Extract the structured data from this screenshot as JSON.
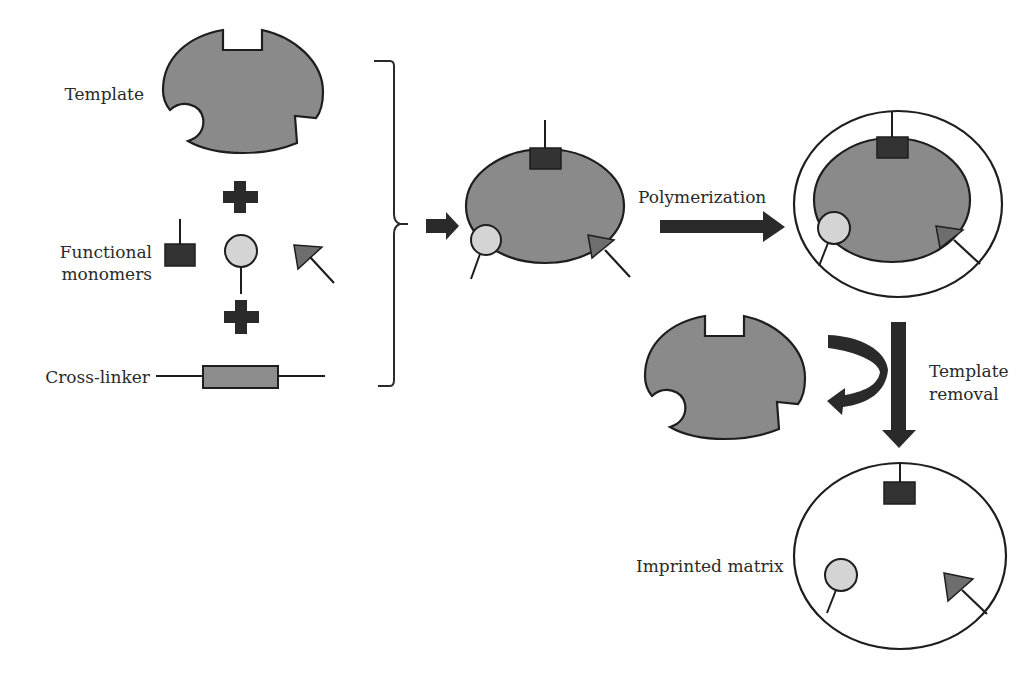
{
  "diagram": {
    "colors": {
      "template_fill": "#8a8a8a",
      "outline": "#1e1e1e",
      "square_monomer": "#333333",
      "circle_monomer": "#d4d4d4",
      "triangle_monomer": "#6e6e6e",
      "crosslinker_fill": "#8c8c8c",
      "arrow": "#1e1e1e",
      "matrix_fill": "#ffffff"
    },
    "labels": {
      "template": "Template",
      "functional_monomers_line1": "Functional",
      "functional_monomers_line2": "monomers",
      "cross_linker": "Cross-linker",
      "polymerization": "Polymerization",
      "template_removal_line1": "Template",
      "template_removal_line2": "removal",
      "imprinted_matrix": "Imprinted matrix"
    },
    "steps": [
      {
        "id": "reagents",
        "items": [
          "Template",
          "Functional monomers",
          "Cross-linker"
        ]
      },
      {
        "id": "complex",
        "description": "template with bound monomers"
      },
      {
        "id": "polymerized",
        "description": "complex embedded in polymer matrix"
      },
      {
        "id": "removed-template",
        "description": "template released"
      },
      {
        "id": "imprinted",
        "description": "Imprinted matrix with cavity sites"
      }
    ],
    "operators": [
      "+",
      "+"
    ]
  }
}
